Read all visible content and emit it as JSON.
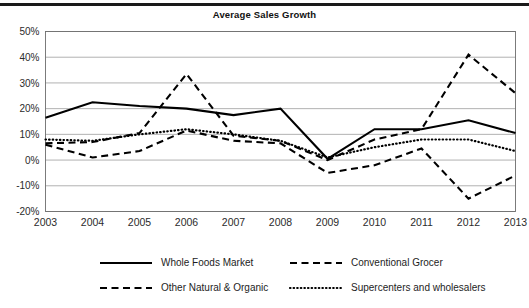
{
  "chart_data": {
    "type": "line",
    "title": "Average Sales Growth",
    "xlabel": "",
    "ylabel": "",
    "grid": true,
    "legend_position": "bottom",
    "ylim": [
      -20,
      50
    ],
    "yticks": [
      50,
      40,
      30,
      20,
      10,
      0,
      -10,
      -20
    ],
    "ytick_labels": [
      "50%",
      "40%",
      "30%",
      "20%",
      "10%",
      "0%",
      "-10%",
      "-20%"
    ],
    "categories": [
      "2003",
      "2004",
      "2005",
      "2006",
      "2007",
      "2008",
      "2009",
      "2010",
      "2011",
      "2012",
      "2013"
    ],
    "x": [
      2003,
      2004,
      2005,
      2006,
      2007,
      2008,
      2009,
      2010,
      2011,
      2012,
      2013
    ],
    "series": [
      {
        "name": "Whole Foods Market",
        "style": "solid",
        "values": [
          16.5,
          22.5,
          21.0,
          20.0,
          17.5,
          20.0,
          0.5,
          12.0,
          12.0,
          15.5,
          10.5
        ]
      },
      {
        "name": "Conventional Grocer",
        "style": "dashed",
        "values": [
          6.0,
          1.0,
          3.5,
          11.5,
          7.5,
          6.5,
          -5.0,
          -2.0,
          4.5,
          -15.0,
          -6.0
        ]
      },
      {
        "name": "Other Natural & Organic",
        "style": "dashed-long",
        "values": [
          6.5,
          7.0,
          10.5,
          33.5,
          9.5,
          7.5,
          0.0,
          8.0,
          12.0,
          41.0,
          26.0
        ]
      },
      {
        "name": "Supercenters and wholesalers",
        "style": "dotted",
        "values": [
          8.0,
          7.5,
          10.0,
          12.0,
          10.0,
          7.5,
          1.0,
          5.0,
          8.0,
          8.0,
          3.5
        ]
      }
    ]
  },
  "legend": {
    "entries": [
      {
        "label": "Whole Foods Market",
        "style": "solid"
      },
      {
        "label": "Conventional Grocer",
        "style": "dashed"
      },
      {
        "label": "Other Natural & Organic",
        "style": "dashed-long"
      },
      {
        "label": "Supercenters and wholesalers",
        "style": "dotted"
      }
    ]
  }
}
